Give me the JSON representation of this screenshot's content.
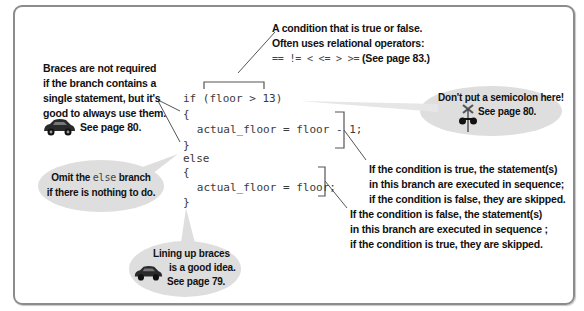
{
  "code": {
    "lines": [
      "if (floor > 13)",
      "{",
      "   actual_floor = floor - 1;",
      "}",
      "else",
      "{",
      "   actual_floor = floor;",
      "}"
    ]
  },
  "annotations": {
    "condition": {
      "lines": [
        "A condition that is true or false.",
        "Often uses relational operators:"
      ],
      "operators": "==  !=  <  <=  >  >=",
      "page_ref": "(See page 83.)"
    },
    "braces": {
      "lines": [
        "Braces are not required",
        "if the branch contains a",
        "single statement, but it's",
        "good to always use them."
      ],
      "page_ref": "See page 80."
    },
    "semicolon_tip": {
      "text": "Don't put a semicolon here!",
      "page_ref": "See page 80."
    },
    "true_branch": {
      "lines": [
        "If the condition is true, the statement(s)",
        "in this branch are executed in sequence;",
        "if the condition is false, they are skipped."
      ]
    },
    "false_branch": {
      "lines": [
        "If the condition is false, the statement(s)",
        "in this branch are executed in sequence ;",
        "if the condition is true, they are skipped."
      ]
    },
    "omit_else": {
      "prefix": "Omit the ",
      "keyword": "else",
      "suffix": " branch",
      "line2": "if there is nothing to do."
    },
    "line_up_braces": {
      "lines": [
        "Lining up braces",
        "is a good idea.",
        "See page 79."
      ]
    }
  },
  "icons": {
    "car": "car-icon",
    "railroad_crossing": "railroad-crossing-icon"
  },
  "colors": {
    "frame_border": "#8c8c8c",
    "bubble_fill": "#dedede",
    "code_text": "#3a3a3a",
    "note_text": "#111111"
  }
}
